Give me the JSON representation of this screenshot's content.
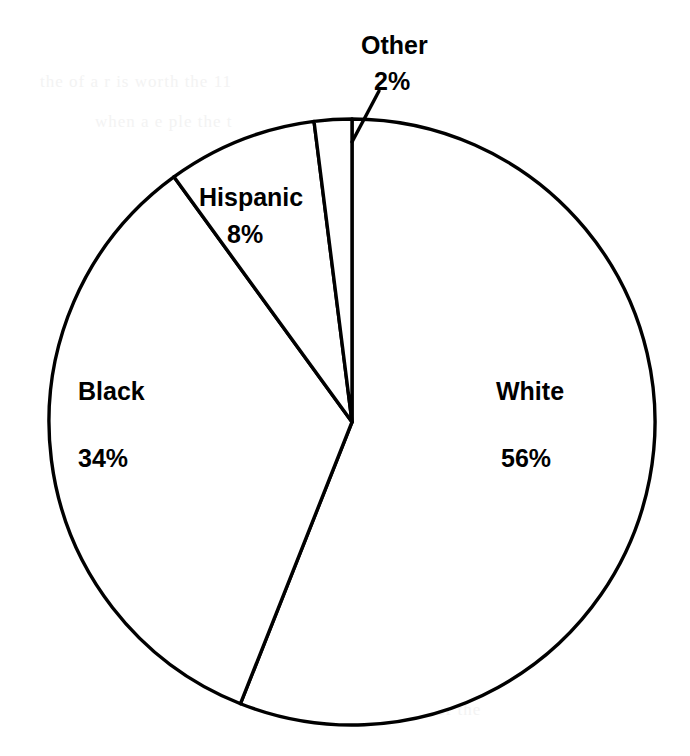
{
  "chart_data": {
    "type": "pie",
    "title": "",
    "subtitle": "",
    "xlabel": "",
    "ylabel": "",
    "legend": "none",
    "grid": false,
    "units": "percent",
    "start_angle_deg": 0,
    "direction": "clockwise",
    "categories": [
      "White",
      "Black",
      "Hispanic",
      "Other"
    ],
    "values": [
      56,
      34,
      8,
      2
    ],
    "slices": [
      {
        "label": "White",
        "value": 56,
        "value_text": "56%",
        "start_deg": 0,
        "end_deg": 201.6,
        "fill": "#ffffff",
        "stroke": "#000000",
        "label_placement": "inside"
      },
      {
        "label": "Black",
        "value": 34,
        "value_text": "34%",
        "start_deg": 201.6,
        "end_deg": 324.0,
        "fill": "#ffffff",
        "stroke": "#000000",
        "label_placement": "inside"
      },
      {
        "label": "Hispanic",
        "value": 8,
        "value_text": "8%",
        "start_deg": 324.0,
        "end_deg": 352.8,
        "fill": "#ffffff",
        "stroke": "#000000",
        "label_placement": "inside"
      },
      {
        "label": "Other",
        "value": 2,
        "value_text": "2%",
        "start_deg": 352.8,
        "end_deg": 360.0,
        "fill": "#ffffff",
        "stroke": "#000000",
        "label_placement": "outside-with-leader"
      }
    ],
    "total": 100,
    "colors": {
      "slice_fill": "#ffffff",
      "outline": "#000000",
      "text": "#000000",
      "background": "#ffffff"
    }
  },
  "artifacts": {
    "row1": "the  of  a  r           is  worth  the            11",
    "row2": "when  a   e   ple   the  t",
    "row3": "ution  of   a  whole   l  is  the",
    "row4": "pie  chart  of  the                    n  of",
    "row5": "chart",
    "row6": "the   2   percent  of  the"
  }
}
